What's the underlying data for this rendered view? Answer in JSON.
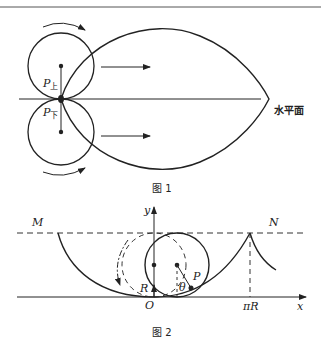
{
  "figure1": {
    "caption": "图 1",
    "surface_label": "水平面",
    "label_upper": "P",
    "label_upper_sub": "上",
    "label_lower": "P",
    "label_lower_sub": "下"
  },
  "figure2": {
    "caption": "图 2",
    "label_M": "M",
    "label_N": "N",
    "label_y": "y",
    "label_x": "x",
    "label_O": "O",
    "label_R": "R",
    "label_P": "P",
    "label_theta": "θ",
    "label_piR": "πR"
  },
  "colors": {
    "stroke": "#222222",
    "background": "#ffffff"
  }
}
